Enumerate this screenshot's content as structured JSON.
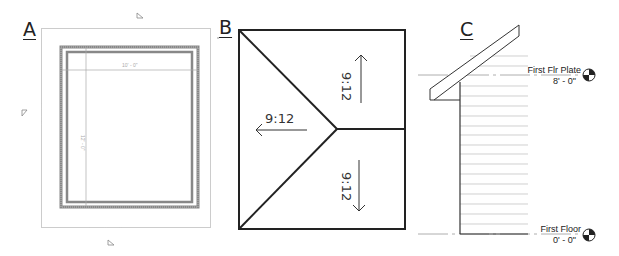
{
  "panels": {
    "a": {
      "label": "A",
      "view": "floor plan",
      "dimensions": {
        "width": "10' - 0\"",
        "depth": "12' - 0\""
      },
      "elevation_markers": 4
    },
    "b": {
      "label": "B",
      "view": "roof plan",
      "slopes": [
        {
          "id": "left",
          "text": "9:12",
          "direction": "left"
        },
        {
          "id": "upper-right",
          "text": "9:12",
          "direction": "up"
        },
        {
          "id": "lower-right",
          "text": "9:12",
          "direction": "down"
        }
      ]
    },
    "c": {
      "label": "C",
      "view": "elevation",
      "levels": [
        {
          "name": "First Flr Plate",
          "elevation": "8' - 0\""
        },
        {
          "name": "First Floor",
          "elevation": "0' - 0\""
        }
      ]
    }
  },
  "colors": {
    "line": "#222222",
    "light_line": "#aaaaaa",
    "wall": "#888888"
  }
}
